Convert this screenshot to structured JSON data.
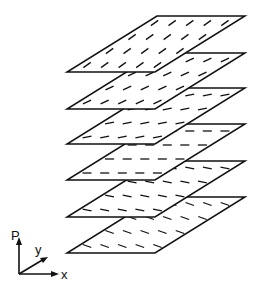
{
  "figure": {
    "line_color": "#111111",
    "background": "#ffffff",
    "layers": [
      {
        "index": 1,
        "top_y": 16,
        "dash_angle_deg": -35
      },
      {
        "index": 2,
        "top_y": 53,
        "dash_angle_deg": -25
      },
      {
        "index": 3,
        "top_y": 88,
        "dash_angle_deg": -12
      },
      {
        "index": 4,
        "top_y": 124,
        "dash_angle_deg": 0
      },
      {
        "index": 5,
        "top_y": 161,
        "dash_angle_deg": 10
      },
      {
        "index": 6,
        "top_y": 197,
        "dash_angle_deg": 20
      }
    ],
    "layer_geometry": {
      "left_bottom_x": 67,
      "skew": 90,
      "width": 88,
      "height": 56
    },
    "axes": {
      "vertical_label": "P",
      "depth_label": "y",
      "horizontal_label": "x"
    }
  }
}
